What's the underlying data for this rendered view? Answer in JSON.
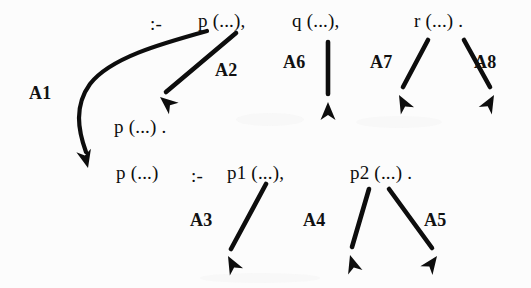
{
  "figure": {
    "background_color": "#fcfcfc",
    "ink_color": "#0d0d0d"
  },
  "code_lines": [
    {
      "id": "goal-clause",
      "tokens": [
        {
          "id": "neck-top",
          "text": ":-",
          "x": 150,
          "y": 14
        },
        {
          "id": "goal-p",
          "text": "p (...),",
          "x": 198,
          "y": 11
        },
        {
          "id": "goal-q",
          "text": "q (...),",
          "x": 292,
          "y": 11
        },
        {
          "id": "goal-r",
          "text": "r (...) .",
          "x": 414,
          "y": 11
        }
      ]
    },
    {
      "id": "fact-clause",
      "tokens": [
        {
          "id": "fact-p",
          "text": "p (...) .",
          "x": 114,
          "y": 117
        }
      ]
    },
    {
      "id": "rule-clause",
      "tokens": [
        {
          "id": "rule-head-p",
          "text": "p (...)",
          "x": 116,
          "y": 163
        },
        {
          "id": "rule-neck",
          "text": ":-",
          "x": 191,
          "y": 166
        },
        {
          "id": "rule-body-p1",
          "text": "p1 (...),",
          "x": 227,
          "y": 163
        },
        {
          "id": "rule-body-p2",
          "text": "p2 (...) .",
          "x": 350,
          "y": 163
        }
      ]
    }
  ],
  "arrow_labels": [
    {
      "id": "A1",
      "text": "A1",
      "x": 29,
      "y": 84
    },
    {
      "id": "A2",
      "text": "A2",
      "x": 215,
      "y": 61
    },
    {
      "id": "A3",
      "text": "A3",
      "x": 190,
      "y": 211
    },
    {
      "id": "A4",
      "text": "A4",
      "x": 303,
      "y": 211
    },
    {
      "id": "A5",
      "text": "A5",
      "x": 424,
      "y": 211
    },
    {
      "id": "A6",
      "text": "A6",
      "x": 283,
      "y": 53
    },
    {
      "id": "A7",
      "text": "A7",
      "x": 370,
      "y": 53
    },
    {
      "id": "A8",
      "text": "A8",
      "x": 474,
      "y": 53
    }
  ],
  "arrows": [
    {
      "id": "A1",
      "kind": "curved",
      "from": "goal-p",
      "to": "rule-head-p",
      "path": "M 207 31 C 160 44, 110 58, 90 84 C 74 106, 78 130, 86 152",
      "head_x": 88,
      "head_y": 168,
      "head_angle": 76
    },
    {
      "id": "A2",
      "kind": "straight",
      "from": "goal-p",
      "to": "fact-p",
      "path": "M 236 33 L 166 92",
      "head_x": 160,
      "head_y": 97,
      "head_angle": 220
    },
    {
      "id": "A3",
      "kind": "straight",
      "from": "rule-body-p1",
      "to": "subgoal-A3",
      "path": "M 266 184 L 231 249",
      "head_x": 228,
      "head_y": 256,
      "head_angle": 242
    },
    {
      "id": "A4",
      "kind": "straight",
      "from": "rule-body-p2",
      "to": "subgoal-A4",
      "path": "M 369 189 L 352 247",
      "head_x": 350,
      "head_y": 255,
      "head_angle": 253
    },
    {
      "id": "A5",
      "kind": "straight",
      "from": "rule-body-p2",
      "to": "subgoal-A5",
      "path": "M 389 189 L 432 248",
      "head_x": 437,
      "head_y": 256,
      "head_angle": 306
    },
    {
      "id": "A6",
      "kind": "straight",
      "from": "goal-q",
      "to": "subgoal-A6",
      "path": "M 328 42 L 328 94",
      "head_x": 328,
      "head_y": 102,
      "head_angle": 270
    },
    {
      "id": "A7",
      "kind": "straight",
      "from": "goal-r",
      "to": "subgoal-A7",
      "path": "M 428 40 L 403 87",
      "head_x": 399,
      "head_y": 95,
      "head_angle": 242
    },
    {
      "id": "A8",
      "kind": "straight",
      "from": "goal-r",
      "to": "subgoal-A8",
      "path": "M 464 40 L 490 87",
      "head_x": 494,
      "head_y": 95,
      "head_angle": 299
    }
  ]
}
